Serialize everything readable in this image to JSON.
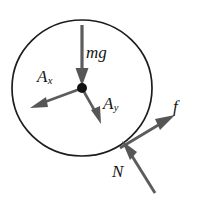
{
  "figure": {
    "kind": "free-body-diagram",
    "title": "",
    "background_color": "#ffffff",
    "stroke_color": "#4a4a4a",
    "outline_color": "#1a1a1a",
    "label_color": "#141414"
  },
  "body": {
    "shape": "circle",
    "center_x": 82,
    "center_y": 88,
    "radius": 70,
    "pivot_label": "center-of-mass-dot"
  },
  "vectors": [
    {
      "id": "mg",
      "label": "mg",
      "subscript": "",
      "description": "weight force acting downward through the center",
      "from_x": 82,
      "from_y": 24,
      "to_x": 82,
      "to_y": 84,
      "label_x": 86,
      "label_y": 44
    },
    {
      "id": "Ax",
      "label": "A",
      "subscript": "x",
      "description": "axle reaction component pointing down-left from the center",
      "from_x": 82,
      "from_y": 88,
      "to_x": 31,
      "to_y": 107,
      "label_x": 37,
      "label_y": 68
    },
    {
      "id": "Ay",
      "label": "A",
      "subscript": "y",
      "description": "axle reaction component pointing down-right from the center",
      "from_x": 82,
      "from_y": 88,
      "to_x": 101,
      "to_y": 123,
      "label_x": 103,
      "label_y": 95
    },
    {
      "id": "f",
      "label": "f",
      "subscript": "",
      "description": "friction force at the contact point pointing up-right",
      "from_x": 121,
      "from_y": 147,
      "to_x": 174,
      "to_y": 116,
      "label_x": 173,
      "label_y": 98
    },
    {
      "id": "N",
      "label": "N",
      "subscript": "",
      "description": "normal force at the contact point pointing up-left",
      "from_x": 154,
      "from_y": 192,
      "to_x": 123,
      "to_y": 142,
      "label_x": 112,
      "label_y": 163
    }
  ]
}
